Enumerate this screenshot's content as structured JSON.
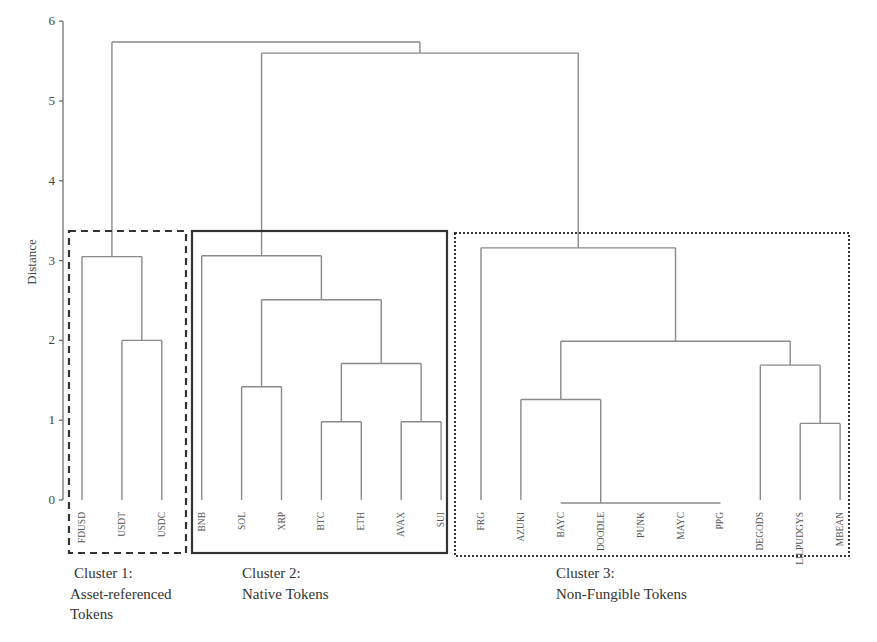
{
  "chart_data": {
    "type": "dendrogram",
    "title": "",
    "xlabel": "",
    "ylabel": "Distance",
    "ylim": [
      0,
      6
    ],
    "yticks": [
      0,
      1,
      2,
      3,
      4,
      5,
      6
    ],
    "grid": false,
    "leaves": [
      "FDUSD",
      "USDT",
      "USDC",
      "BNB",
      "SOL",
      "XRP",
      "BTC",
      "ETH",
      "AVAX",
      "SUI",
      "FRG",
      "AZUKI",
      "BAYC",
      "DOODLE",
      "PUNK",
      "MAYC",
      "PPG",
      "DEGODS",
      "LILPUDGYS",
      "MBEAN"
    ],
    "merges": [
      {
        "id": "m1",
        "children": [
          "USDT",
          "USDC"
        ],
        "height": 2.0
      },
      {
        "id": "m2",
        "children": [
          "FDUSD",
          "m1"
        ],
        "height": 3.05
      },
      {
        "id": "m3",
        "children": [
          "BTC",
          "ETH"
        ],
        "height": 0.98
      },
      {
        "id": "m4",
        "children": [
          "AVAX",
          "SUI"
        ],
        "height": 0.98
      },
      {
        "id": "m5",
        "children": [
          "m3",
          "m4"
        ],
        "height": 1.71
      },
      {
        "id": "m6",
        "children": [
          "SOL",
          "XRP"
        ],
        "height": 1.42
      },
      {
        "id": "m7",
        "children": [
          "m6",
          "m5"
        ],
        "height": 2.51
      },
      {
        "id": "m8",
        "children": [
          "BNB",
          "m7"
        ],
        "height": 3.06
      },
      {
        "id": "m9",
        "children": [
          "BAYC",
          "DOODLE",
          "PUNK",
          "MAYC",
          "PPG"
        ],
        "height": 0.0
      },
      {
        "id": "m10",
        "children": [
          "AZUKI",
          "m9"
        ],
        "height": 1.26
      },
      {
        "id": "m11",
        "children": [
          "LILPUDGYS",
          "MBEAN"
        ],
        "height": 0.96
      },
      {
        "id": "m12",
        "children": [
          "DEGODS",
          "m11"
        ],
        "height": 1.69
      },
      {
        "id": "m13",
        "children": [
          "m10",
          "m12"
        ],
        "height": 1.99
      },
      {
        "id": "m14",
        "children": [
          "FRG",
          "m13"
        ],
        "height": 3.16
      },
      {
        "id": "m15",
        "children": [
          "m8",
          "m14"
        ],
        "height": 5.6
      },
      {
        "id": "m16",
        "children": [
          "m2",
          "m15"
        ],
        "height": 5.74
      }
    ],
    "clusters": [
      {
        "name": "Cluster 1:",
        "description": [
          "Asset-referenced",
          "Tokens"
        ],
        "members": [
          "FDUSD",
          "USDT",
          "USDC"
        ],
        "border": "dashed"
      },
      {
        "name": "Cluster 2:",
        "description": [
          "Native Tokens"
        ],
        "members": [
          "BNB",
          "SOL",
          "XRP",
          "BTC",
          "ETH",
          "AVAX",
          "SUI"
        ],
        "border": "solid"
      },
      {
        "name": "Cluster 3:",
        "description": [
          "Non-Fungible Tokens"
        ],
        "members": [
          "FRG",
          "AZUKI",
          "BAYC",
          "DOODLE",
          "PUNK",
          "MAYC",
          "PPG",
          "DEGODS",
          "LILPUDGYS",
          "MBEAN"
        ],
        "border": "dotted"
      }
    ]
  },
  "colors": {
    "branch": "#8a8a8a",
    "cluster_border": "#333333",
    "text": "#444444"
  }
}
